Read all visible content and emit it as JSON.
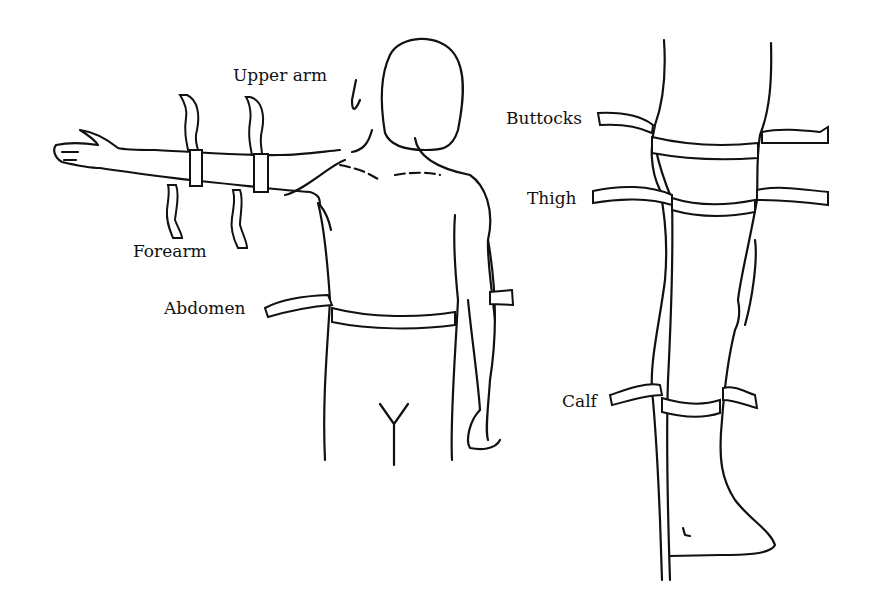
{
  "diagram": {
    "labels": {
      "upper_arm": "Upper arm",
      "forearm": "Forearm",
      "abdomen": "Abdomen",
      "buttocks": "Buttocks",
      "thigh": "Thigh",
      "calf": "Calf"
    },
    "figures": [
      "front-view-upper-body-with-raised-arm",
      "side-view-leg"
    ],
    "colors": {
      "line": "#111111",
      "background": "#ffffff"
    }
  }
}
